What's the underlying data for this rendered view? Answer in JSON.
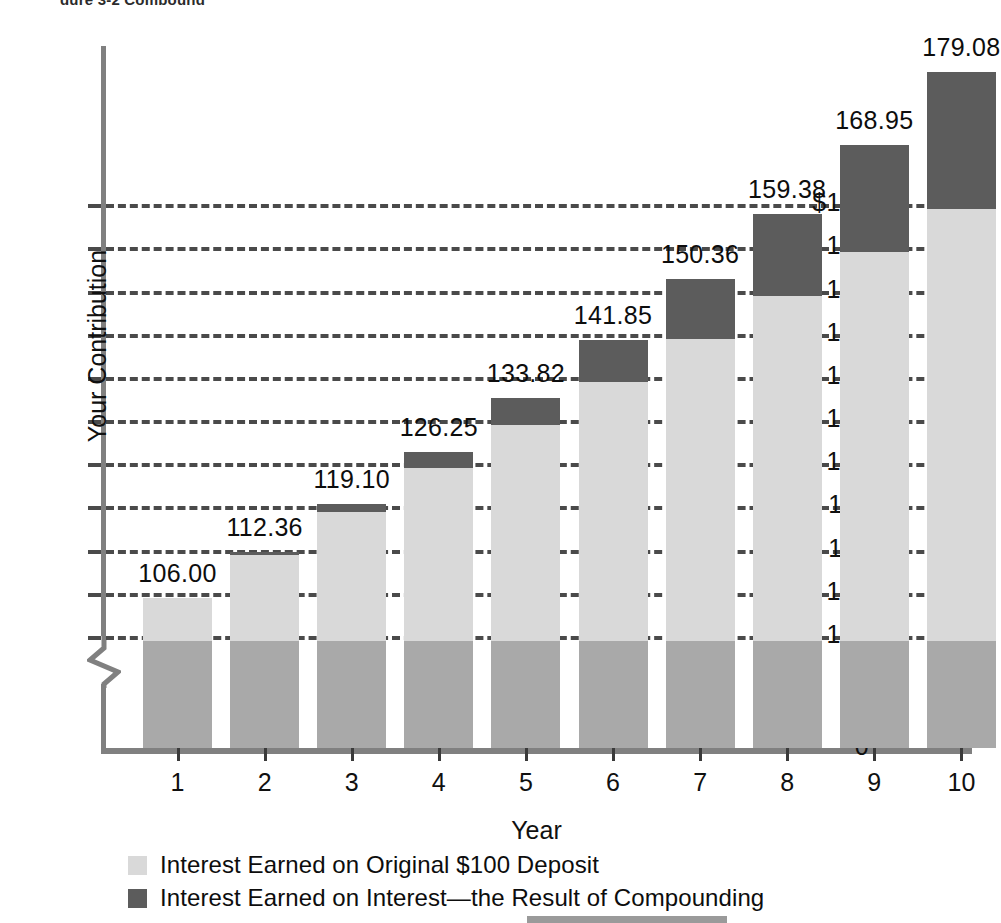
{
  "figure": {
    "title_fragment": "gure 3-2  Compound",
    "background_color": "#ffffff"
  },
  "axes": {
    "y_axis_title": "Your Contribution",
    "x_axis_title": "Year",
    "y_tick_labels": [
      "$160",
      "154",
      "148",
      "142",
      "136",
      "130",
      "124",
      "118",
      "112",
      "106",
      "100"
    ],
    "y_zero_label": "0",
    "x_tick_labels": [
      "1",
      "2",
      "3",
      "4",
      "5",
      "6",
      "7",
      "8",
      "9",
      "10"
    ],
    "axis_break": true
  },
  "legend": {
    "items": [
      {
        "label": "Interest Earned on Original $100 Deposit",
        "color": "#d9d9d9",
        "swatch_name": "legend-swatch-simple-interest"
      },
      {
        "label": "Interest Earned on Interest—the Result of Compounding",
        "color": "#5c5c5c",
        "swatch_name": "legend-swatch-compound-interest"
      }
    ]
  },
  "colors": {
    "principal": "#a9a9a9",
    "simple_interest": "#d9d9d9",
    "compound_interest": "#5c5c5c",
    "axis": "#808080",
    "gridline": "#4a4a4a",
    "text": "#101010"
  },
  "chart_data": {
    "type": "bar",
    "subtype": "stacked",
    "xlabel": "Year",
    "ylabel": "Your Contribution",
    "categories": [
      "1",
      "2",
      "3",
      "4",
      "5",
      "6",
      "7",
      "8",
      "9",
      "10"
    ],
    "ylim": [
      100,
      182
    ],
    "y_axis_break_below": 100,
    "y_ticks": [
      100,
      106,
      112,
      118,
      124,
      130,
      136,
      142,
      148,
      154,
      160
    ],
    "y_tick_labels": [
      "100",
      "106",
      "112",
      "118",
      "124",
      "130",
      "136",
      "142",
      "148",
      "154",
      "$160"
    ],
    "grid": true,
    "grid_style": "dashed-horizontal",
    "legend_position": "bottom-left",
    "annotation_labels": [
      "106.00",
      "112.36",
      "119.10",
      "126.25",
      "133.82",
      "141.85",
      "150.36",
      "159.38",
      "168.95",
      "179.08"
    ],
    "series": [
      {
        "name": "Your Contribution (Original $100 Deposit)",
        "color": "#a9a9a9",
        "values": [
          100,
          100,
          100,
          100,
          100,
          100,
          100,
          100,
          100,
          100
        ]
      },
      {
        "name": "Interest Earned on Original $100 Deposit",
        "color": "#d9d9d9",
        "values": [
          6,
          12,
          18,
          24,
          30,
          36,
          42,
          48,
          54,
          60
        ],
        "cumulative_top": [
          106,
          112,
          118,
          124,
          130,
          136,
          142,
          148,
          154,
          160
        ]
      },
      {
        "name": "Interest Earned on Interest—the Result of Compounding",
        "color": "#5c5c5c",
        "values": [
          0.0,
          0.36,
          1.1,
          2.25,
          3.82,
          5.85,
          8.36,
          11.38,
          14.95,
          19.08
        ],
        "cumulative_top": [
          106.0,
          112.36,
          119.1,
          126.25,
          133.82,
          141.85,
          150.36,
          159.38,
          168.95,
          179.08
        ]
      }
    ],
    "totals": [
      106.0,
      112.36,
      119.1,
      126.25,
      133.82,
      141.85,
      150.36,
      159.38,
      168.95,
      179.08
    ]
  }
}
